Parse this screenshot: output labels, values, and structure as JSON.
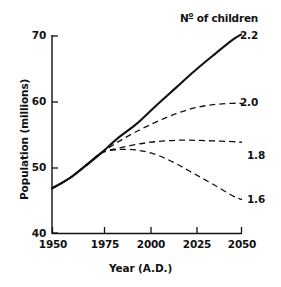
{
  "chart_data": {
    "type": "line",
    "title": "",
    "xlabel": "Year (A.D.)",
    "ylabel": "Population (millions)",
    "xlim": [
      1950,
      2050
    ],
    "ylim": [
      40,
      70
    ],
    "xticks": [
      1950,
      1975,
      2000,
      2025,
      2050
    ],
    "yticks": [
      40,
      50,
      60,
      70
    ],
    "xtick_labels": [
      "1950",
      "1975",
      "2000",
      "2025",
      "2050"
    ],
    "ytick_labels": [
      "40",
      "50",
      "60",
      "70"
    ],
    "grid": false,
    "legend_title": "Nº of children",
    "legend_position": "right-of-curve-ends",
    "legend_entries": [
      "2.2",
      "2.0",
      "1.8",
      "1.6"
    ],
    "x": [
      1950,
      1960,
      1970,
      1976,
      1985,
      1995,
      2005,
      2015,
      2025,
      2035,
      2045,
      2050
    ],
    "series": [
      {
        "name": "2.2",
        "label": "2.2",
        "style": "solid",
        "values": [
          46.9,
          48.6,
          50.9,
          52.3,
          54.6,
          56.8,
          59.5,
          62.1,
          64.7,
          67.1,
          69.4,
          70.3
        ]
      },
      {
        "name": "2.0",
        "label": "2.0",
        "style": "dashed",
        "values": [
          46.9,
          48.6,
          50.9,
          52.3,
          54.0,
          55.6,
          57.0,
          58.2,
          59.1,
          59.6,
          59.8,
          59.8
        ]
      },
      {
        "name": "1.8",
        "label": "1.8",
        "style": "dashed",
        "values": [
          46.9,
          48.6,
          50.9,
          52.3,
          53.0,
          53.6,
          54.0,
          54.2,
          54.2,
          54.1,
          54.0,
          53.9
        ]
      },
      {
        "name": "1.6",
        "label": "1.6",
        "style": "dashed",
        "values": [
          46.9,
          48.6,
          50.9,
          52.3,
          52.8,
          52.7,
          52.0,
          50.7,
          49.1,
          47.5,
          45.8,
          45.2
        ]
      }
    ]
  },
  "axes": {
    "y_title": "Population (millions)",
    "x_title": "Year (A.D.)"
  },
  "legend": {
    "title_prefix": "N",
    "title_ordinal": "o",
    "title_suffix": " of children",
    "title_full": "Nº of children"
  },
  "labels": {
    "y": [
      "70",
      "60",
      "50",
      "40"
    ],
    "x": [
      "1950",
      "1975",
      "2000",
      "2025",
      "2050"
    ],
    "series": [
      "2.2",
      "2.0",
      "1.8",
      "1.6"
    ]
  }
}
